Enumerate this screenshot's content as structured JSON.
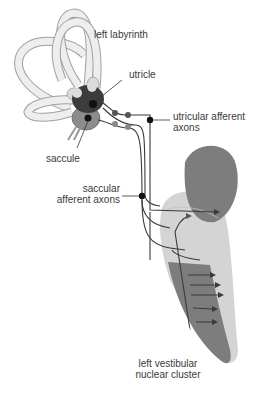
{
  "labels": {
    "left_labyrinth": "left labyrinth",
    "utricle": "utricle",
    "utricular_line1": "utricular afferent",
    "utricular_line2": "axons",
    "saccule": "saccule",
    "saccular_line1": "saccular",
    "saccular_line2": "afferent axons",
    "nucleus_line1": "left vestibular",
    "nucleus_line2": "nuclear cluster"
  },
  "colors": {
    "canal_fill": "#eeeeee",
    "canal_stroke": "#9a9a9a",
    "utricle": "#3c3c3c",
    "saccule": "#8c8c8c",
    "nucleus_dark": "#7d7d7d",
    "nucleus_light": "#d4d4d4",
    "axon": "#3a3a3a",
    "dot": "#111111"
  }
}
